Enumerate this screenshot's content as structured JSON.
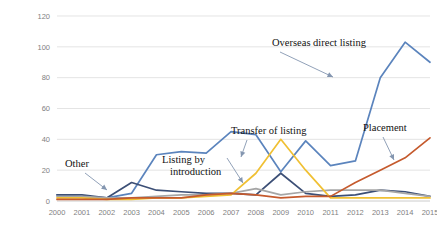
{
  "chart_data": {
    "type": "line",
    "title": "",
    "xlabel": "",
    "ylabel": "",
    "x": [
      2000,
      2001,
      2002,
      2003,
      2004,
      2005,
      2006,
      2007,
      2008,
      2009,
      2010,
      2011,
      2012,
      2013,
      2014,
      2015
    ],
    "xticklabels": [
      "2000",
      "2001",
      "2002",
      "2003",
      "2004",
      "2005",
      "2006",
      "2007",
      "2008",
      "2009",
      "2010",
      "2011",
      "2012",
      "2013",
      "2014",
      "2015"
    ],
    "yticklabels": [
      "0",
      "20",
      "40",
      "60",
      "80",
      "100",
      "120"
    ],
    "yticks": [
      0,
      20,
      40,
      60,
      80,
      100,
      120
    ],
    "ylim": [
      0,
      120
    ],
    "grid": "horizontal",
    "legend": "annotations",
    "series": [
      {
        "name": "Overseas direct listing",
        "color": "#5b84bd",
        "values": [
          4,
          3,
          2,
          5,
          30,
          32,
          31,
          45,
          43,
          19,
          39,
          23,
          26,
          80,
          103,
          90
        ]
      },
      {
        "name": "Other",
        "color": "#3c4f76",
        "values": [
          4,
          4,
          2,
          12,
          7,
          6,
          5,
          5,
          4,
          18,
          5,
          3,
          4,
          7,
          6,
          3
        ]
      },
      {
        "name": "Listing by introduction",
        "color": "#a6a6a6",
        "values": [
          3,
          3,
          2,
          2,
          3,
          4,
          4,
          5,
          8,
          4,
          6,
          7,
          7,
          7,
          5,
          3
        ]
      },
      {
        "name": "Transfer of listing",
        "color": "#f0c033",
        "values": [
          2,
          2,
          1,
          1,
          2,
          2,
          3,
          4,
          18,
          40,
          20,
          2,
          2,
          2,
          2,
          2
        ]
      },
      {
        "name": "Placement",
        "color": "#c55a2d",
        "values": [
          1,
          1,
          1,
          2,
          2,
          2,
          4,
          5,
          4,
          2,
          3,
          3,
          12,
          20,
          28,
          41
        ]
      }
    ],
    "annotations": [
      {
        "name": "overseas-direct-listing",
        "label": "Overseas direct listing",
        "x": 272,
        "y": 46
      },
      {
        "name": "transfer-of-listing",
        "label": "Transfer of listing",
        "x": 231,
        "y": 134
      },
      {
        "name": "listing-by-introduction",
        "label": "Listing by",
        "label2": "introduction",
        "x": 162,
        "y": 163
      },
      {
        "name": "placement",
        "label": "Placement",
        "x": 363,
        "y": 131
      },
      {
        "name": "other",
        "label": "Other",
        "x": 65,
        "y": 167
      }
    ]
  }
}
